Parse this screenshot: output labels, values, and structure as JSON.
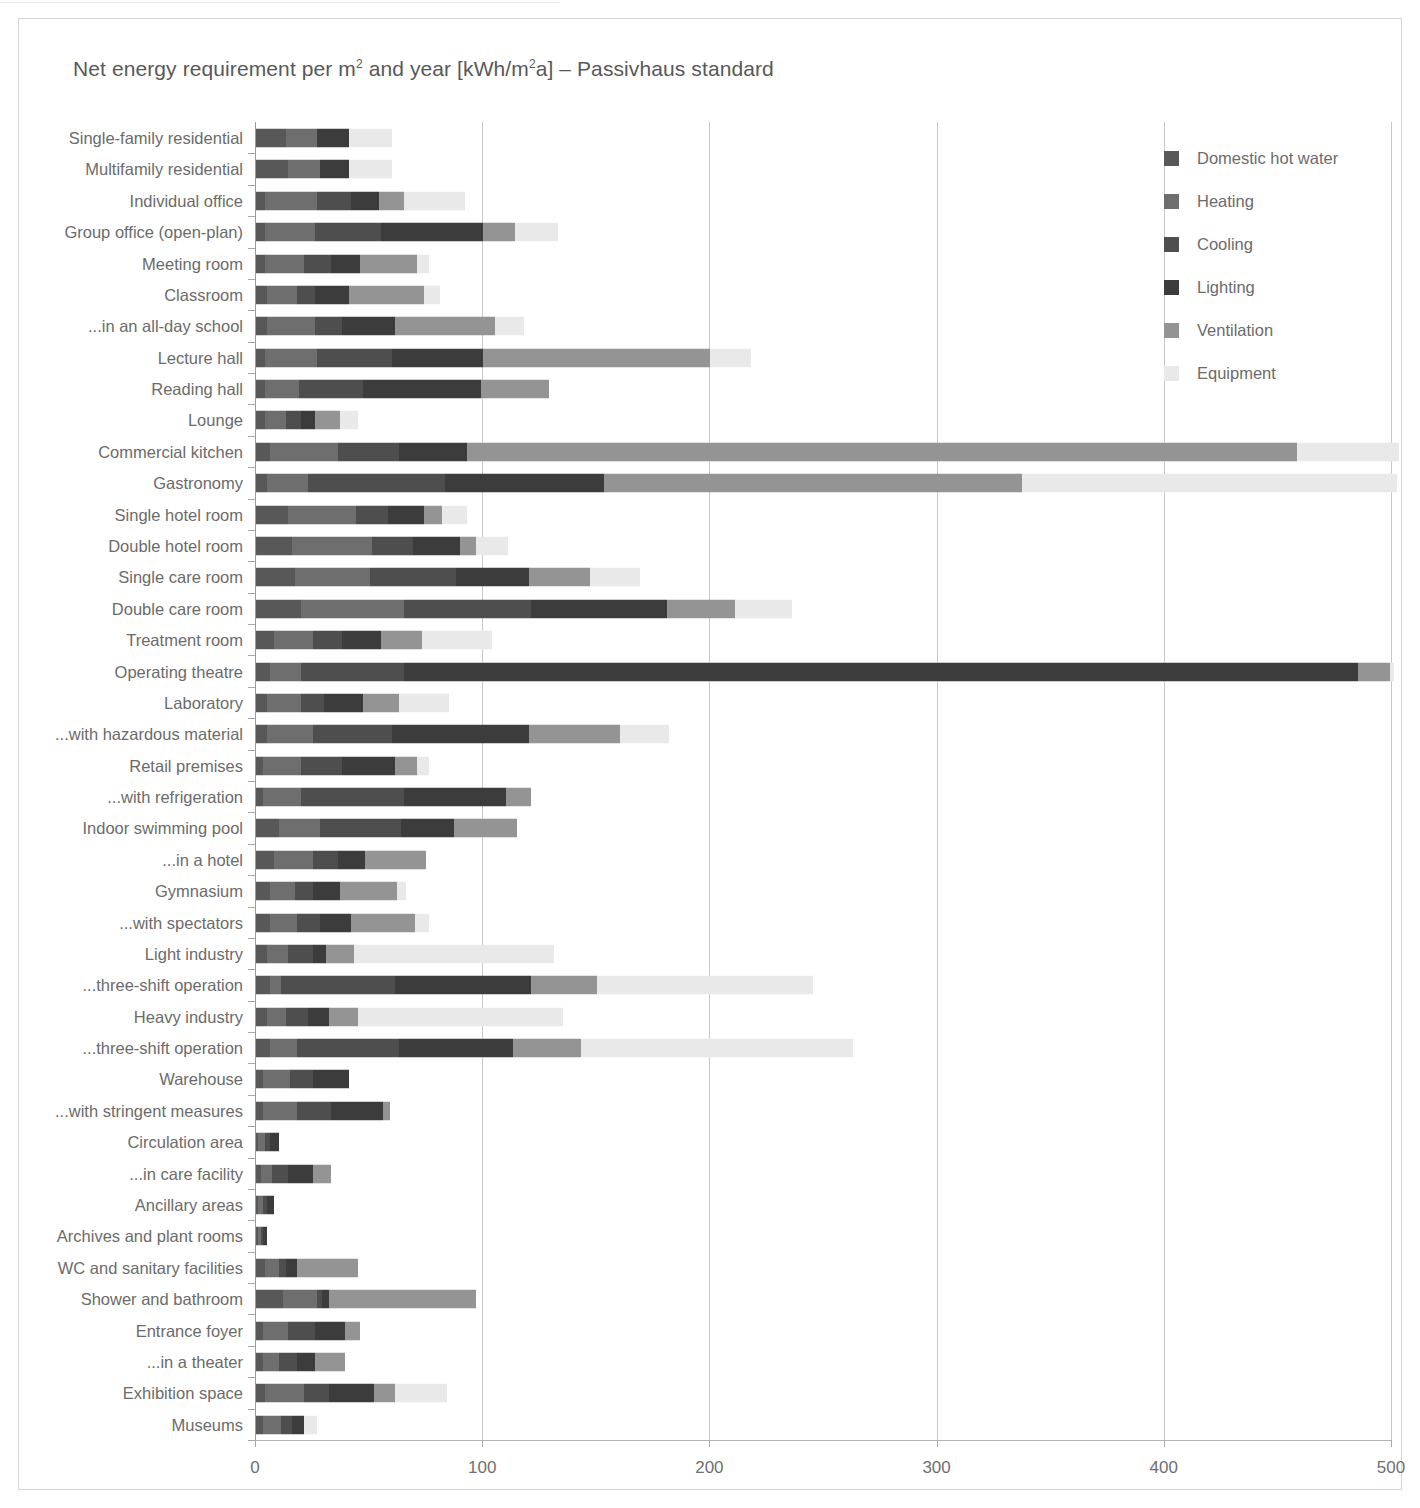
{
  "chart_title_html": "Net energy requirement per m<sup>2</sup> and year [kWh/m<sup>2</sup>a] – Passivhaus standard",
  "chart_title_text": "Net energy requirement per m2 and year [kWh/m2a] – Passivhaus standard",
  "legend": {
    "position": "top-right",
    "items": [
      {
        "label": "Domestic hot water",
        "color": "#585858"
      },
      {
        "label": "Heating",
        "color": "#6e6e6e"
      },
      {
        "label": "Cooling",
        "color": "#4e4e4e"
      },
      {
        "label": "Lighting",
        "color": "#3c3c3c"
      },
      {
        "label": "Ventilation",
        "color": "#949494"
      },
      {
        "label": "Equipment",
        "color": "#e9e9e9"
      }
    ]
  },
  "axis": {
    "x_ticks": [
      "0",
      "100",
      "200",
      "300",
      "400",
      "500"
    ],
    "x_min": 0,
    "x_max": 500,
    "x_unit": "kWh/m2a"
  },
  "chart_data": {
    "type": "bar",
    "orientation": "horizontal",
    "stacked": true,
    "title": "Net energy requirement per m2 and year [kWh/m2a] – Passivhaus standard",
    "xlabel": "",
    "ylabel": "",
    "xlim": [
      0,
      500
    ],
    "grid": true,
    "legend_position": "top-right",
    "series": [
      {
        "name": "Domestic hot water",
        "color": "#585858"
      },
      {
        "name": "Heating",
        "color": "#6e6e6e"
      },
      {
        "name": "Cooling",
        "color": "#4e4e4e"
      },
      {
        "name": "Lighting",
        "color": "#3c3c3c"
      },
      {
        "name": "Ventilation",
        "color": "#949494"
      },
      {
        "name": "Equipment",
        "color": "#e9e9e9"
      }
    ],
    "categories": [
      "Single-family residential",
      "Multifamily residential",
      "Individual office",
      "Group office (open-plan)",
      "Meeting room",
      "Classroom",
      "...in an all-day school",
      "Lecture hall",
      "Reading hall",
      "Lounge",
      "Commercial kitchen",
      "Gastronomy",
      "Single hotel room",
      "Double hotel room",
      "Single care room",
      "Double care room",
      "Treatment room",
      "Operating theatre",
      "Laboratory",
      "...with hazardous material",
      "Retail premises",
      "...with refrigeration",
      "Indoor swimming pool",
      "...in a hotel",
      "Gymnasium",
      "...with spectators",
      "Light industry",
      "...three-shift operation",
      "Heavy industry",
      "...three-shift operation",
      "Warehouse",
      "...with stringent measures",
      "Circulation area",
      "...in care facility",
      "Ancillary areas",
      "Archives and plant rooms",
      "WC and sanitary facilities",
      "Shower and bathroom",
      "Entrance foyer",
      "...in a theater",
      "Exhibition space",
      "Museums"
    ],
    "rows": [
      {
        "category": "Single-family residential",
        "values": [
          13,
          14,
          0,
          14,
          0,
          19
        ],
        "total": 60
      },
      {
        "category": "Multifamily residential",
        "values": [
          14,
          14,
          0,
          13,
          0,
          19
        ],
        "total": 60
      },
      {
        "category": "Individual office",
        "values": [
          4,
          23,
          15,
          12,
          11,
          27
        ],
        "total": 92
      },
      {
        "category": "Group office (open-plan)",
        "values": [
          4,
          22,
          29,
          45,
          14,
          19
        ],
        "total": 133
      },
      {
        "category": "Meeting room",
        "values": [
          4,
          17,
          12,
          13,
          25,
          5
        ],
        "total": 76
      },
      {
        "category": "Classroom",
        "values": [
          5,
          13,
          8,
          15,
          33,
          7
        ],
        "total": 81
      },
      {
        "category": "...in an all-day school",
        "values": [
          5,
          21,
          12,
          23,
          44,
          13
        ],
        "total": 118
      },
      {
        "category": "Lecture hall",
        "values": [
          4,
          23,
          33,
          40,
          100,
          18
        ],
        "total": 218
      },
      {
        "category": "Reading hall",
        "values": [
          4,
          15,
          28,
          52,
          30,
          0
        ],
        "total": 129
      },
      {
        "category": "Lounge",
        "values": [
          4,
          9,
          7,
          6,
          11,
          8
        ],
        "total": 45
      },
      {
        "category": "Commercial kitchen",
        "values": [
          6,
          30,
          27,
          30,
          365,
          45
        ],
        "total": 503
      },
      {
        "category": "Gastronomy",
        "values": [
          5,
          18,
          60,
          70,
          184,
          165
        ],
        "total": 502
      },
      {
        "category": "Single hotel room",
        "values": [
          14,
          30,
          14,
          16,
          8,
          11
        ],
        "total": 93
      },
      {
        "category": "Double hotel room",
        "values": [
          16,
          35,
          18,
          21,
          7,
          14
        ],
        "total": 111
      },
      {
        "category": "Single care room",
        "values": [
          17,
          33,
          38,
          32,
          27,
          22
        ],
        "total": 169
      },
      {
        "category": "Double care room",
        "values": [
          20,
          45,
          56,
          60,
          30,
          25
        ],
        "total": 236
      },
      {
        "category": "Treatment room",
        "values": [
          8,
          17,
          13,
          17,
          18,
          31
        ],
        "total": 104
      },
      {
        "category": "Operating theatre",
        "values": [
          6,
          14,
          45,
          420,
          14,
          2
        ],
        "total": 501
      },
      {
        "category": "Laboratory",
        "values": [
          5,
          15,
          10,
          17,
          16,
          22
        ],
        "total": 85
      },
      {
        "category": "...with hazardous material",
        "values": [
          5,
          20,
          35,
          60,
          40,
          22
        ],
        "total": 182
      },
      {
        "category": "Retail premises",
        "values": [
          3,
          17,
          18,
          23,
          10,
          5
        ],
        "total": 76
      },
      {
        "category": "...with refrigeration",
        "values": [
          3,
          17,
          45,
          45,
          11,
          0
        ],
        "total": 121
      },
      {
        "category": "Indoor swimming pool",
        "values": [
          10,
          18,
          36,
          23,
          28,
          0
        ],
        "total": 115
      },
      {
        "category": "...in a hotel",
        "values": [
          8,
          17,
          11,
          12,
          27,
          0
        ],
        "total": 75
      },
      {
        "category": "Gymnasium",
        "values": [
          6,
          11,
          8,
          12,
          25,
          4
        ],
        "total": 66
      },
      {
        "category": "...with spectators",
        "values": [
          6,
          12,
          10,
          14,
          28,
          6
        ],
        "total": 76
      },
      {
        "category": "Light industry",
        "values": [
          5,
          9,
          11,
          6,
          12,
          88
        ],
        "total": 131
      },
      {
        "category": "...three-shift operation",
        "values": [
          6,
          5,
          50,
          60,
          29,
          95
        ],
        "total": 245
      },
      {
        "category": "Heavy industry",
        "values": [
          5,
          8,
          10,
          9,
          13,
          90
        ],
        "total": 135
      },
      {
        "category": "...three-shift operation",
        "values": [
          6,
          12,
          45,
          50,
          30,
          120
        ],
        "total": 263
      },
      {
        "category": "Warehouse",
        "values": [
          3,
          12,
          10,
          16,
          0,
          0
        ],
        "total": 41
      },
      {
        "category": "...with stringent measures",
        "values": [
          3,
          15,
          15,
          23,
          3,
          0
        ],
        "total": 59
      },
      {
        "category": "Circulation area",
        "values": [
          1,
          3,
          2,
          4,
          0,
          0
        ],
        "total": 10
      },
      {
        "category": "...in care facility",
        "values": [
          2,
          5,
          7,
          11,
          8,
          0
        ],
        "total": 33
      },
      {
        "category": "Ancillary areas",
        "values": [
          1,
          2,
          2,
          3,
          0,
          0
        ],
        "total": 8
      },
      {
        "category": "Archives and plant rooms",
        "values": [
          1,
          1,
          1,
          2,
          0,
          0
        ],
        "total": 5
      },
      {
        "category": "WC and sanitary facilities",
        "values": [
          4,
          6,
          3,
          5,
          27,
          0
        ],
        "total": 45
      },
      {
        "category": "Shower and bathroom",
        "values": [
          12,
          15,
          2,
          3,
          65,
          0
        ],
        "total": 97
      },
      {
        "category": "Entrance foyer",
        "values": [
          3,
          11,
          12,
          13,
          7,
          0
        ],
        "total": 46
      },
      {
        "category": "...in a theater",
        "values": [
          3,
          7,
          8,
          8,
          13,
          0
        ],
        "total": 39
      },
      {
        "category": "Exhibition space",
        "values": [
          4,
          17,
          11,
          20,
          9,
          23
        ],
        "total": 84
      },
      {
        "category": "Museums",
        "values": [
          3,
          8,
          5,
          5,
          0,
          6
        ],
        "total": 27
      }
    ]
  }
}
